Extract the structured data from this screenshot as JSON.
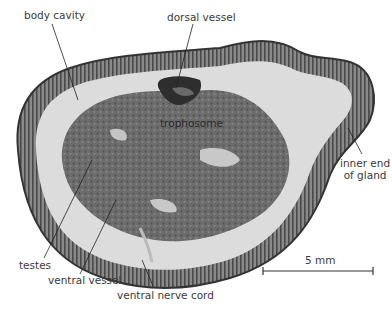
{
  "figure": {
    "type": "micrograph",
    "labels": {
      "body_cavity": "body cavity",
      "dorsal_vessel": "dorsal vessel",
      "trophosome": "trophosome",
      "inner_end_of_gland_line1": "inner end",
      "inner_end_of_gland_line2": "of gland",
      "testes": "testes",
      "ventral_vessel": "ventral vessel",
      "ventral_nerve_cord": "ventral nerve cord"
    },
    "scale_bar": {
      "label": "5 mm"
    },
    "colors": {
      "background": "#ffffff",
      "epidermis_outline": "#3c3c3c",
      "gland_layer": "#6e6e6e",
      "cavity": "#dcdcdc",
      "trophosome": "#6a6a6a",
      "vessel": "#3a3a3a",
      "label_text": "#3a3a3a"
    }
  }
}
